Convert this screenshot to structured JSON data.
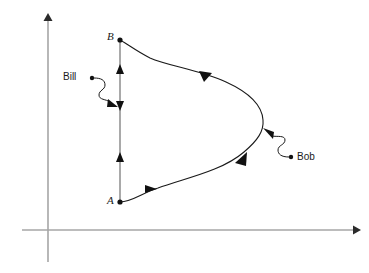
{
  "figure": {
    "title": "",
    "background_color": "#ffffff",
    "width": 369,
    "height": 273
  },
  "axes": {
    "color": "#a6a6a6",
    "arrow_color": "#1a1a1a",
    "x_axis": {
      "name": "x-axis",
      "from": [
        22,
        230
      ],
      "to": [
        358,
        230
      ],
      "arrow": "right"
    },
    "y_axis": {
      "name": "y-axis",
      "from": [
        48,
        262
      ],
      "to": [
        48,
        14
      ],
      "arrow": "up"
    }
  },
  "curves": {
    "color": "#1a1a1a",
    "vertical_path": {
      "label": "Bill",
      "name": "straight-path-bill",
      "from_point": "A",
      "to_point": "B",
      "x": 120,
      "y_top": 40,
      "y_bottom": 202,
      "arrow_marks": [
        {
          "y": 70,
          "direction": "up"
        },
        {
          "y": 105,
          "direction": "down"
        },
        {
          "y": 157,
          "direction": "up"
        }
      ]
    },
    "curved_path": {
      "label": "Bob",
      "name": "curved-path-bob",
      "from_point": "A",
      "to_point": "B",
      "rightmost_x": 263,
      "rightmost_y": 120,
      "arrow_marks": [
        {
          "x": 205,
          "y": 75,
          "direction": "left"
        },
        {
          "x": 150,
          "y": 189,
          "direction": "right"
        },
        {
          "x": 243,
          "y": 158,
          "direction": "up-right"
        }
      ]
    }
  },
  "labels": {
    "bill": {
      "text": "Bill",
      "dot": [
        92,
        78
      ],
      "leader": "squiggle",
      "points_to": [
        119,
        107
      ]
    },
    "bob": {
      "text": "Bob",
      "dot": [
        291,
        157
      ],
      "leader": "squiggle",
      "points_to": [
        264,
        133
      ]
    },
    "point_a": {
      "text": "A",
      "dot": [
        120,
        202
      ]
    },
    "point_b": {
      "text": "B",
      "dot": [
        120,
        40
      ]
    }
  }
}
